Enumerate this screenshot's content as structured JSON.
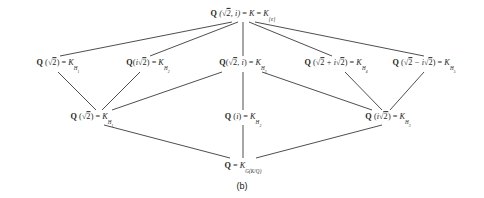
{
  "diagram": {
    "caption": "(b)",
    "nodes": {
      "top": {
        "field": "Q",
        "generators": "(√2, i)",
        "eq1": "=",
        "middle": "K",
        "eq2": "=",
        "group": "K",
        "group_sub": "{e}",
        "full": "Q (√2, i) = K = K{e}"
      },
      "row2": [
        {
          "field": "Q",
          "generators": "(√2)",
          "eq": "=",
          "right": "K",
          "right_sub": "H",
          "right_sub_index": "1",
          "full": "Q (√2) = K_H1"
        },
        {
          "field": "Q",
          "generators": "(i√2)",
          "eq": "=",
          "right": "K",
          "right_sub": "H",
          "right_sub_index": "2",
          "full": "Q (i√2) = K_H2"
        },
        {
          "field": "Q",
          "generators": "(√2, i)",
          "eq": "=",
          "right": "K",
          "right_sub": "H",
          "right_sub_index": "3",
          "full": "Q (√2, i) = K_H3"
        },
        {
          "field": "Q",
          "generators": "(√2 + i√2)",
          "eq": "=",
          "right": "K",
          "right_sub": "H",
          "right_sub_index": "4",
          "full": "Q (√2 + i√2) = K_H4"
        },
        {
          "field": "Q",
          "generators": "(√2 − i√2)",
          "eq": "=",
          "right": "K",
          "right_sub": "H",
          "right_sub_index": "5",
          "full": "Q (√2 − i√2) = K_H5"
        }
      ],
      "row3": [
        {
          "field": "Q",
          "generators": "(√2)",
          "eq": "=",
          "right": "K",
          "right_sub": "H",
          "right_sub_index": "1",
          "full": "Q (√2) = K_H1"
        },
        {
          "field": "Q",
          "generators": "(i)",
          "eq": "=",
          "right": "K",
          "right_sub": "H",
          "right_sub_index": "2",
          "full": "Q (i) = K_H2"
        },
        {
          "field": "Q",
          "generators": "(i√2)",
          "eq": "=",
          "right": "K",
          "right_sub": "H",
          "right_sub_index": "3",
          "full": "Q (i√2) = K_H3"
        }
      ],
      "bottom": {
        "field": "Q",
        "eq": "=",
        "right": "K",
        "right_sub": "G(K/Q)",
        "full": "Q = K_G(K/Q)"
      }
    },
    "colors": {
      "edge": "#3a3a3a",
      "text": "#1f1f1f",
      "background": "#ffffff"
    }
  }
}
